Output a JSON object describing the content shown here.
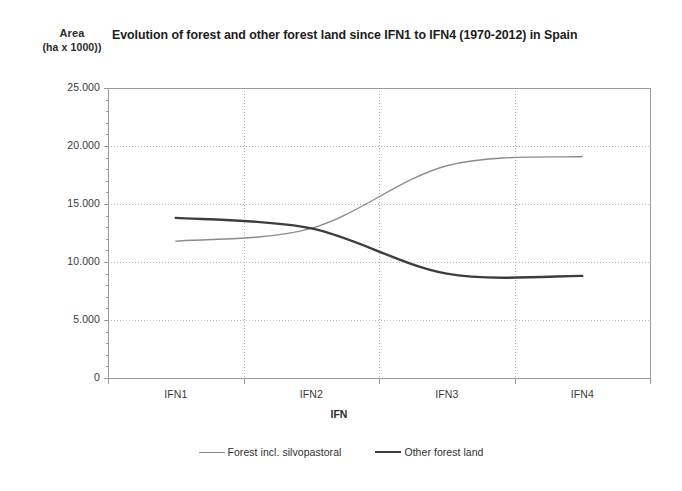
{
  "chart_data": {
    "type": "line",
    "title": "Evolution of forest and other forest land since IFN1 to IFN4 (1970-2012) in Spain",
    "ylabel_line1": "Area",
    "ylabel_line2": "(ha x 1000))",
    "xlabel": "IFN",
    "categories": [
      "IFN1",
      "IFN2",
      "IFN3",
      "IFN4"
    ],
    "series": [
      {
        "name": "Forest incl. silvopastoral",
        "color": "#8b8b8b",
        "width": 1.4,
        "values": [
          11800,
          12900,
          18300,
          19100
        ]
      },
      {
        "name": "Other forest land",
        "color": "#3d3d3d",
        "width": 2.4,
        "values": [
          13800,
          12900,
          9000,
          8800
        ]
      }
    ],
    "ylim": [
      0,
      25000
    ],
    "ytick_labels": [
      "25.000",
      "20.000",
      "15.000",
      "10.000",
      "5.000",
      "0"
    ],
    "ytick_values": [
      25000,
      20000,
      15000,
      10000,
      5000,
      0
    ],
    "grid": true,
    "grid_style": "dotted",
    "legend_position": "bottom",
    "plot_bg": "#ffffff",
    "axis_color": "#9a9a9a",
    "grid_color": "#b9b9b9"
  }
}
